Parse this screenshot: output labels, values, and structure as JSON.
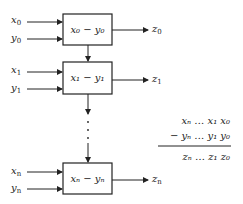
{
  "diagram": {
    "type": "cascaded-subtractor-block-diagram",
    "stages": [
      {
        "id": "stage-0",
        "inputs": [
          "x0",
          "y0"
        ],
        "label": "x0 − y0",
        "output": "z0"
      },
      {
        "id": "stage-1",
        "inputs": [
          "x1",
          "y1"
        ],
        "label": "x1 − y1",
        "output": "z1"
      },
      {
        "id": "stage-n",
        "inputs": [
          "xn",
          "yn"
        ],
        "label": "xn − yn",
        "output": "zn"
      }
    ],
    "ellipsis": "⋮",
    "equation": {
      "row1": "xn … x1 x0",
      "row2": "− yn … y1 y0",
      "result": "zn … z1 z0"
    },
    "stroke_color": "#222222",
    "background": "#ffffff"
  },
  "labels": {
    "x0": "x",
    "x0_sub": "0",
    "y0": "y",
    "y0_sub": "0",
    "x1": "x",
    "x1_sub": "1",
    "y1": "y",
    "y1_sub": "1",
    "xn": "x",
    "xn_sub": "n",
    "yn": "y",
    "yn_sub": "n",
    "z0": "z",
    "z0_sub": "0",
    "z1": "z",
    "z1_sub": "1",
    "zn": "z",
    "zn_sub": "n",
    "box0": "x₀ − y₀",
    "box1": "x₁ − y₁",
    "boxn": "xₙ − yₙ",
    "eq_row1": "xₙ … x₁ x₀",
    "eq_row2": "− yₙ … y₁ y₀",
    "eq_result": "zₙ … z₁ z₀"
  }
}
